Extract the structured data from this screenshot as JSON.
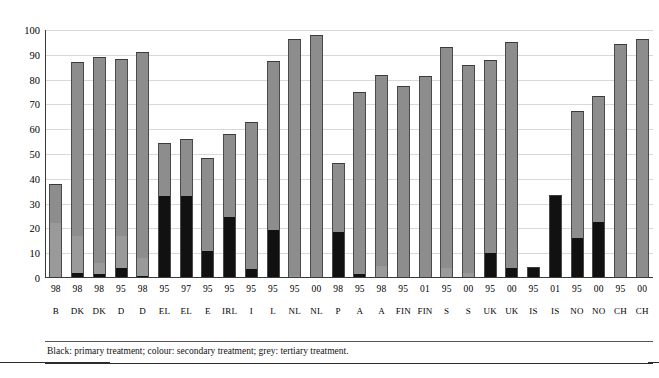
{
  "figure": {
    "footnote": "Black: primary treatment; colour: secondary treatment; grey: tertiary treatment.",
    "colors": {
      "primary": "#111111",
      "secondary": "#9a9a9a",
      "tertiary": "#8d8d8d",
      "gridline": "#d8d8d8",
      "axis": "#3a3a3a"
    }
  },
  "chart_data": {
    "type": "bar",
    "title": "",
    "subtitle": "",
    "xlabel": "",
    "ylabel": "",
    "ylim": [
      0,
      100
    ],
    "yticks": [
      0,
      10,
      20,
      30,
      40,
      50,
      60,
      70,
      80,
      90,
      100
    ],
    "ytick_labels": [
      "0",
      "10",
      "20",
      "30",
      "40",
      "50",
      "60",
      "70",
      "80",
      "90",
      "100"
    ],
    "grid": true,
    "stacked": true,
    "legend": "none",
    "legend_note": "Black: primary treatment; colour: secondary treatment; grey: tertiary treatment.",
    "categories": [
      "B",
      "DK",
      "DK",
      "D",
      "D",
      "EL",
      "EL",
      "E",
      "IRL",
      "I",
      "L",
      "NL",
      "NL",
      "P",
      "A",
      "A",
      "FIN",
      "FIN",
      "S",
      "S",
      "UK",
      "UK",
      "IS",
      "IS",
      "NO",
      "NO",
      "CH",
      "CH"
    ],
    "years": [
      "98",
      "98",
      "98",
      "95",
      "98",
      "95",
      "97",
      "95",
      "95",
      "95",
      "95",
      "95",
      "00",
      "98",
      "95",
      "98",
      "95",
      "01",
      "95",
      "00",
      "95",
      "00",
      "95",
      "01",
      "95",
      "00",
      "95",
      "00"
    ],
    "series": [
      {
        "name": "primary treatment",
        "color": "#111111",
        "values": [
          0,
          2,
          1.5,
          4,
          1,
          33,
          33,
          11,
          24.5,
          3.5,
          19.5,
          0,
          0,
          18.5,
          1.5,
          0,
          0,
          0,
          0,
          0,
          10,
          4,
          4.5,
          33.5,
          16,
          22.5,
          0,
          0
        ]
      },
      {
        "name": "secondary treatment",
        "color": "#9a9a9a",
        "values": [
          22,
          15,
          4.5,
          13,
          7,
          0,
          0,
          0,
          0,
          0,
          0,
          1,
          0,
          0,
          0,
          5,
          0,
          0,
          4,
          2,
          0,
          0,
          0,
          0,
          0,
          0,
          0,
          0
        ]
      },
      {
        "name": "tertiary treatment",
        "color": "#8d8d8d",
        "values": [
          16,
          70,
          83,
          71.5,
          83,
          21.5,
          23,
          37.5,
          33.5,
          59.5,
          68,
          95.5,
          98,
          28,
          73.5,
          77,
          77.5,
          81.5,
          89,
          84,
          78,
          91,
          0,
          0,
          51.5,
          51,
          94.5,
          96.5
        ]
      }
    ],
    "totals": [
      38,
      87,
      89,
      88.5,
      91,
      54.5,
      56,
      48.5,
      58,
      63,
      87.5,
      96.5,
      98,
      46.5,
      75,
      82,
      77.5,
      81.5,
      93,
      86,
      88,
      95,
      4.5,
      33.5,
      67.5,
      73.5,
      94.5,
      96.5
    ]
  }
}
